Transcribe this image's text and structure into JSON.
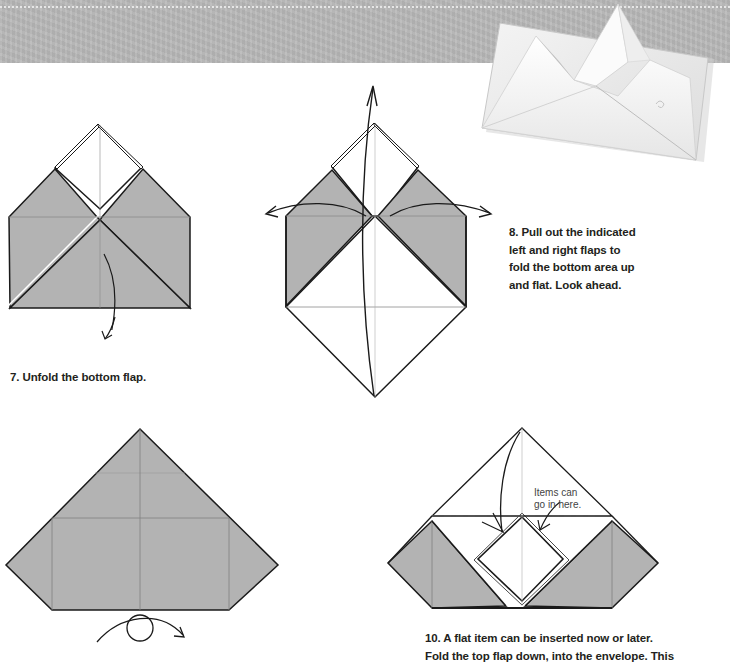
{
  "header": {
    "band_color": "#b9b9b9",
    "photo_alt": "finished origami envelope with pointed flap"
  },
  "colors": {
    "paper_colored_side": "#b3b3b3",
    "paper_white_side": "#ffffff",
    "line": "#1a1a1a",
    "crease": "#8c8c8c"
  },
  "steps": [
    {
      "number": 7,
      "caption": "7. Unfold the bottom flap.",
      "diagram": "unfold-bottom-flap"
    },
    {
      "number": 8,
      "caption_lines": [
        "8. Pull out the indicated",
        "left and right flaps to",
        "fold the bottom area up",
        "and flat. Look ahead."
      ],
      "diagram": "pull-out-flaps"
    },
    {
      "number": 9,
      "caption": "",
      "diagram": "turn-over",
      "symbol": "turn-over-icon"
    },
    {
      "number": 10,
      "caption_lines": [
        "10. A flat item can be inserted now or later.",
        "Fold the top flap down, into the envelope. This"
      ],
      "callout_lines": [
        "Items can",
        "go in here."
      ],
      "diagram": "insert-item"
    }
  ]
}
